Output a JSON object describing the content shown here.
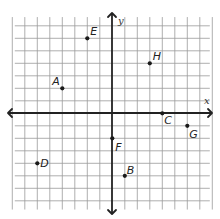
{
  "figure": {
    "type": "coordinate-plane",
    "x_axis_label": "x",
    "y_axis_label": "y",
    "x_range": [
      -7,
      7
    ],
    "y_range": [
      -7,
      7
    ],
    "grid_step": 1,
    "grid": true
  },
  "points": [
    {
      "label": "A",
      "x": -4,
      "y": 2
    },
    {
      "label": "B",
      "x": 1,
      "y": -5
    },
    {
      "label": "C",
      "x": 4,
      "y": 0
    },
    {
      "label": "D",
      "x": -6,
      "y": -4
    },
    {
      "label": "E",
      "x": -2,
      "y": 6
    },
    {
      "label": "F",
      "x": 0,
      "y": -2
    },
    {
      "label": "G",
      "x": 6,
      "y": -1
    },
    {
      "label": "H",
      "x": 3,
      "y": 4
    }
  ]
}
